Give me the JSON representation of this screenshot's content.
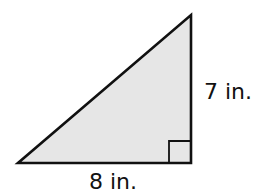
{
  "figure": {
    "shape": "right-triangle",
    "fill_color": "#e6e6e6",
    "stroke_color": "#111111",
    "vertices": {
      "bottom_left": [
        18,
        163
      ],
      "right_angle": [
        191,
        163
      ],
      "top": [
        191,
        15
      ]
    },
    "right_angle_marker": true
  },
  "labels": {
    "height": "7 in.",
    "base": "8 in."
  }
}
